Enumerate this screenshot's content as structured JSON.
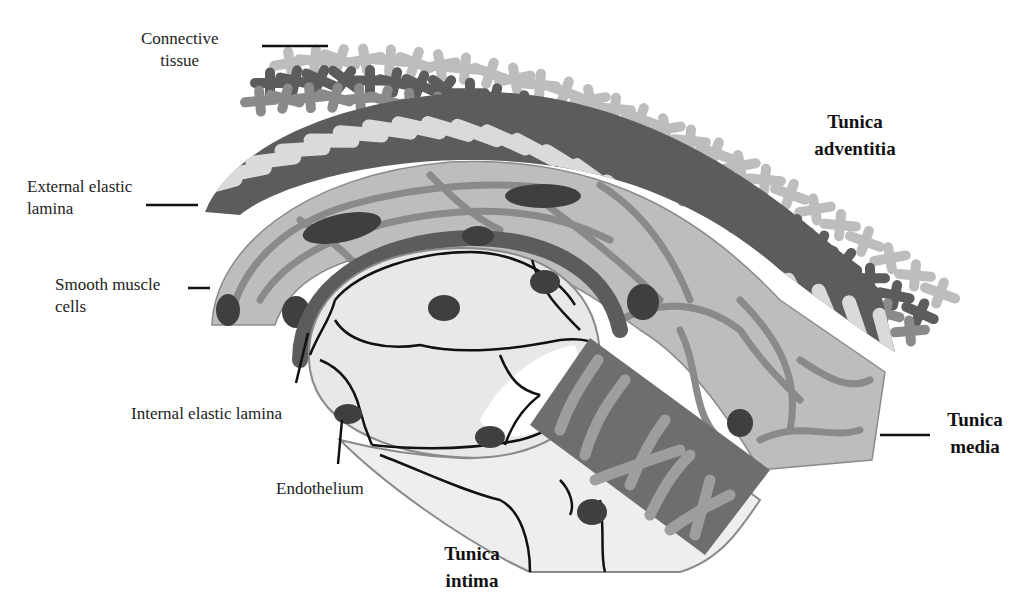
{
  "figure": {
    "colors": {
      "background": "#ffffff",
      "dark_gray": "#5c5c5c",
      "mid_gray": "#8a8a8a",
      "light_gray": "#bdbdbd",
      "pale_gray": "#e6e6e6",
      "nucleus": "#3f3f3f",
      "line": "#111111"
    }
  },
  "labels": {
    "connective_tissue": [
      "Connective",
      "tissue"
    ],
    "external_elastic_lamina": [
      "External elastic",
      "lamina"
    ],
    "smooth_muscle_cells": [
      "Smooth muscle",
      "cells"
    ],
    "internal_elastic_lamina": [
      "Internal elastic lamina"
    ],
    "endothelium": [
      "Endothelium"
    ],
    "tunica_adventitia": [
      "Tunica",
      "adventitia"
    ],
    "tunica_media": [
      "Tunica",
      "media"
    ],
    "tunica_intima": [
      "Tunica",
      "intima"
    ]
  }
}
